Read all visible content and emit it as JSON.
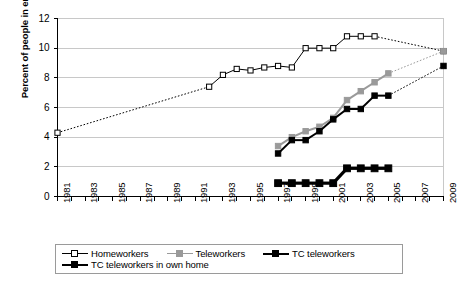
{
  "chart_data": {
    "type": "line",
    "title": "",
    "xlabel": "",
    "ylabel": "Percent of people in employment",
    "ylim": [
      0,
      12
    ],
    "ytick_step": 2,
    "yticks": [
      "12",
      "10",
      "8",
      "6",
      "4",
      "2",
      "0"
    ],
    "xlim": [
      1981,
      2009
    ],
    "grid": "horizontal",
    "legend_position": "bottom",
    "xticks": [
      "1981",
      "1983",
      "1985",
      "1987",
      "1989",
      "1991",
      "1993",
      "1995",
      "1997",
      "1999",
      "2001",
      "2003",
      "2005",
      "2007",
      "2009"
    ],
    "x_all_years": [
      1981,
      1982,
      1983,
      1984,
      1985,
      1986,
      1987,
      1988,
      1989,
      1990,
      1991,
      1992,
      1993,
      1994,
      1995,
      1996,
      1997,
      1998,
      1999,
      2000,
      2001,
      2002,
      2003,
      2004,
      2005,
      2006,
      2007,
      2008,
      2009
    ],
    "series": [
      {
        "name": "Homeworkers",
        "color": "#000000",
        "marker": "open-square",
        "points": [
          {
            "x": 1981,
            "y": 4.3,
            "style": "marker"
          },
          {
            "x": 1992,
            "y": 7.4,
            "style": "marker"
          },
          {
            "x": 1993,
            "y": 8.2,
            "style": "marker"
          },
          {
            "x": 1994,
            "y": 8.6,
            "style": "marker"
          },
          {
            "x": 1995,
            "y": 8.5,
            "style": "marker"
          },
          {
            "x": 1996,
            "y": 8.7,
            "style": "marker"
          },
          {
            "x": 1997,
            "y": 8.8,
            "style": "marker"
          },
          {
            "x": 1998,
            "y": 8.7,
            "style": "marker"
          },
          {
            "x": 1999,
            "y": 10.0,
            "style": "marker"
          },
          {
            "x": 2000,
            "y": 10.0,
            "style": "marker"
          },
          {
            "x": 2001,
            "y": 10.0,
            "style": "marker"
          },
          {
            "x": 2002,
            "y": 10.8,
            "style": "marker"
          },
          {
            "x": 2003,
            "y": 10.8,
            "style": "marker"
          },
          {
            "x": 2004,
            "y": 10.8,
            "style": "marker"
          },
          {
            "x": 2009,
            "y": 9.8,
            "style": "marker"
          }
        ],
        "dashed_segments": [
          [
            1981,
            1992
          ],
          [
            2004,
            2009
          ]
        ]
      },
      {
        "name": "Teleworkers",
        "color": "#9a9a9a",
        "marker": "filled-square",
        "points": [
          {
            "x": 1997,
            "y": 3.4,
            "style": "marker"
          },
          {
            "x": 1998,
            "y": 4.0,
            "style": "marker"
          },
          {
            "x": 1999,
            "y": 4.4,
            "style": "marker"
          },
          {
            "x": 2000,
            "y": 4.7,
            "style": "marker"
          },
          {
            "x": 2001,
            "y": 5.3,
            "style": "marker"
          },
          {
            "x": 2002,
            "y": 6.5,
            "style": "marker"
          },
          {
            "x": 2003,
            "y": 7.1,
            "style": "marker"
          },
          {
            "x": 2004,
            "y": 7.7,
            "style": "marker"
          },
          {
            "x": 2005,
            "y": 8.3,
            "style": "marker"
          },
          {
            "x": 2009,
            "y": 9.8,
            "style": "marker"
          }
        ],
        "dashed_segments": [
          [
            2005,
            2009
          ]
        ]
      },
      {
        "name": "TC teleworkers",
        "color": "#000000",
        "marker": "filled-square",
        "points": [
          {
            "x": 1997,
            "y": 2.9,
            "style": "marker"
          },
          {
            "x": 1998,
            "y": 3.8,
            "style": "marker"
          },
          {
            "x": 1999,
            "y": 3.8,
            "style": "marker"
          },
          {
            "x": 2000,
            "y": 4.4,
            "style": "marker"
          },
          {
            "x": 2001,
            "y": 5.2,
            "style": "marker"
          },
          {
            "x": 2002,
            "y": 5.9,
            "style": "marker"
          },
          {
            "x": 2003,
            "y": 5.9,
            "style": "marker"
          },
          {
            "x": 2004,
            "y": 6.8,
            "style": "marker"
          },
          {
            "x": 2005,
            "y": 6.8,
            "style": "marker"
          },
          {
            "x": 2009,
            "y": 8.8,
            "style": "marker"
          }
        ],
        "dashed_segments": [
          [
            2005,
            2009
          ]
        ]
      },
      {
        "name": "TC teleworkers in own home",
        "color": "#000000",
        "marker": "filled-square-bold",
        "points": [
          {
            "x": 1997,
            "y": 0.9,
            "style": "marker"
          },
          {
            "x": 1998,
            "y": 0.9,
            "style": "marker"
          },
          {
            "x": 1999,
            "y": 0.9,
            "style": "marker"
          },
          {
            "x": 2000,
            "y": 0.9,
            "style": "marker"
          },
          {
            "x": 2001,
            "y": 0.9,
            "style": "marker"
          },
          {
            "x": 2002,
            "y": 1.9,
            "style": "marker"
          },
          {
            "x": 2003,
            "y": 1.9,
            "style": "marker"
          },
          {
            "x": 2004,
            "y": 1.9,
            "style": "marker"
          },
          {
            "x": 2005,
            "y": 1.9,
            "style": "marker"
          }
        ],
        "dashed_segments": []
      }
    ]
  },
  "legend": {
    "items": [
      {
        "label": "Homeworkers",
        "key": "open-square"
      },
      {
        "label": "Teleworkers",
        "key": "gray-square"
      },
      {
        "label": "TC teleworkers",
        "key": "black-square"
      },
      {
        "label": "TC teleworkers in own home",
        "key": "bold-black-square"
      }
    ]
  },
  "colors": {
    "axis": "#000000",
    "grid": "#c8c8c8",
    "homeworkers": "#000000",
    "teleworkers": "#9a9a9a",
    "tc_teleworkers": "#000000",
    "tc_own_home": "#000000",
    "background": "#ffffff"
  }
}
